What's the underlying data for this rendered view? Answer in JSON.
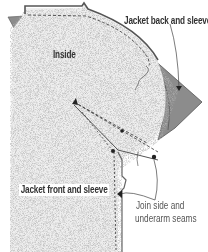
{
  "diagram": {
    "type": "sewing-instruction-illustration",
    "labels": {
      "back": "Jacket back and sleeve",
      "inside": "Inside",
      "front": "Jacket front and sleeve",
      "seam_line1": "Join side and",
      "seam_line2": "underarm seams"
    },
    "colors": {
      "fabric_light": "#efefef",
      "fabric_speckle": "#9a9a9a",
      "back_panel": "#8c8c8c",
      "outline": "#555555",
      "stitch": "#333333",
      "text_bold": "#333333",
      "text_light": "#555555",
      "background": "#ffffff"
    }
  }
}
